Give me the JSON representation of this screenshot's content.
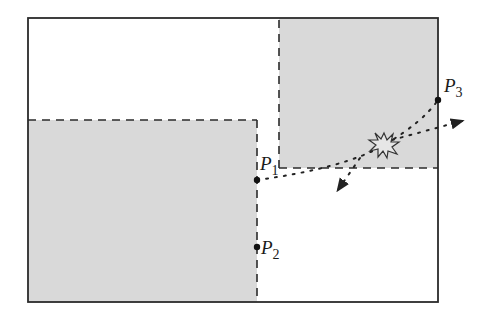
{
  "diagram": {
    "colors": {
      "background": "#ffffff",
      "region_fill": "#d9d9d9",
      "stroke": "#2b2b2b",
      "point": "#111111"
    },
    "frame": {
      "x": 28,
      "y": 18,
      "width": 410,
      "height": 284
    },
    "regions": [
      {
        "name": "upper-right-shaded",
        "x": 279,
        "y": 18,
        "width": 159,
        "height": 150
      },
      {
        "name": "lower-left-shaded",
        "x": 28,
        "y": 120,
        "width": 229,
        "height": 182
      }
    ],
    "points": [
      {
        "id": "P1",
        "base": "P",
        "sub": "1",
        "x": 257,
        "y": 180
      },
      {
        "id": "P2",
        "base": "P",
        "sub": "2",
        "x": 257,
        "y": 247
      },
      {
        "id": "P3",
        "base": "P",
        "sub": "3",
        "x": 438,
        "y": 100
      }
    ],
    "paths": [
      {
        "name": "curved-trajectory-p1-to-p3",
        "style": "dotted"
      },
      {
        "name": "deflected-trajectory-right",
        "style": "dotted-arrow"
      },
      {
        "name": "deflected-trajectory-down-left",
        "style": "dotted-arrow"
      }
    ],
    "event_marker": {
      "name": "collision-burst",
      "x": 384,
      "y": 145
    }
  }
}
